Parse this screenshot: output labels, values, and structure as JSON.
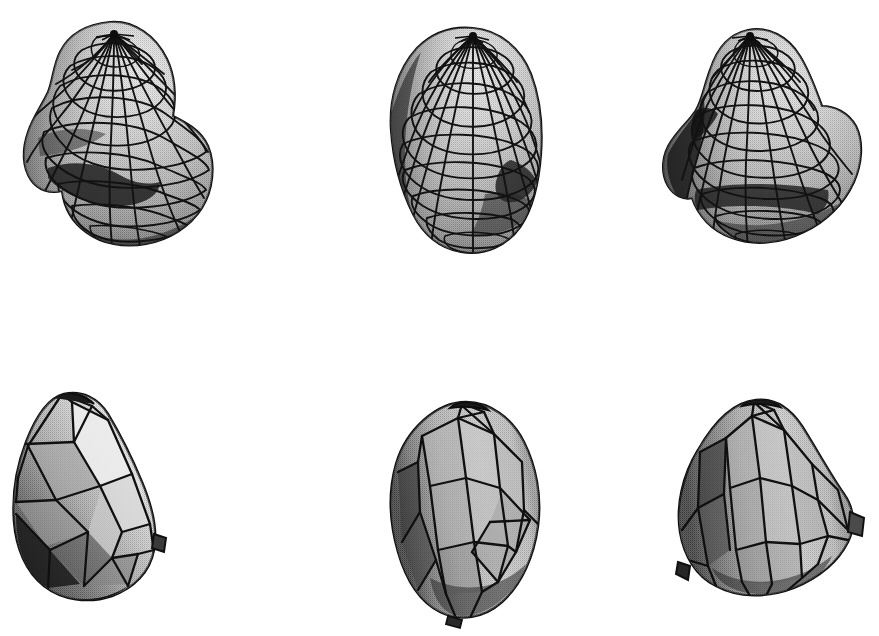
{
  "figure": {
    "title": "Six shaded 3D mesh surfaces",
    "background_color": "#ffffff",
    "canvas": {
      "width": 879,
      "height": 636
    },
    "rows": 2,
    "columns": 3,
    "render_style": "halftone-dithered grayscale shaded surface with black wireframe",
    "ink_color": "#111111",
    "palette": {
      "highlight": "#efefef",
      "light": "#d2d2d2",
      "mid": "#aeaeae",
      "mid_dark": "#8c8c8c",
      "dark": "#5e5e5e",
      "shadow": "#2f2f2f",
      "deep_shadow": "#141414",
      "wire": "#141414",
      "background": "#ffffff"
    }
  },
  "shapes": [
    {
      "id": "shape-1",
      "name": "blob-top-left",
      "row": 1,
      "column": 1,
      "mesh_type": "quadrilateral lat-long grid",
      "pole_visible": true,
      "pole_style": "radial meridian convergence",
      "bbox": {
        "x": 16,
        "y": 16,
        "width": 200,
        "height": 230
      },
      "light_direction": "upper-right",
      "features": "bulbous upper lobe with pole cap, deep concave crease at lower left, secondary lobe at bottom",
      "latitude_bands": 11,
      "meridians": 24
    },
    {
      "id": "shape-2",
      "name": "blob-top-center",
      "row": 1,
      "column": 2,
      "mesh_type": "quadrilateral lat-long grid",
      "pole_visible": true,
      "pole_style": "radial meridian convergence",
      "bbox": {
        "x": 372,
        "y": 22,
        "width": 190,
        "height": 232
      },
      "light_direction": "upper-right",
      "features": "ovoid body, faceted flat bottom, concave notch on lower right flank",
      "latitude_bands": 11,
      "meridians": 24
    },
    {
      "id": "shape-3",
      "name": "blob-top-right",
      "row": 1,
      "column": 3,
      "mesh_type": "quadrilateral lat-long grid",
      "pole_visible": true,
      "pole_style": "radial meridian convergence",
      "bbox": {
        "x": 660,
        "y": 22,
        "width": 205,
        "height": 225
      },
      "light_direction": "upper-right",
      "features": "conical upper pole, protruding lobe on left flank, horizontal shelf crease near bottom",
      "latitude_bands": 11,
      "meridians": 24
    },
    {
      "id": "shape-4",
      "name": "polyhedral-bottom-left",
      "row": 2,
      "column": 1,
      "mesh_type": "coarse triangulated facets",
      "pole_visible": true,
      "pole_style": "flattened apex",
      "bbox": {
        "x": 10,
        "y": 390,
        "width": 152,
        "height": 215
      },
      "light_direction": "upper-right",
      "features": "tilted wedge form, bright highlight facets on upper right, deep shadow along lower left rim, small spur at right edge",
      "facet_count": 42
    },
    {
      "id": "shape-5",
      "name": "polyhedral-bottom-center",
      "row": 2,
      "column": 2,
      "mesh_type": "coarse triangulated facets with spiral banding",
      "pole_visible": true,
      "pole_style": "flattened apex",
      "bbox": {
        "x": 382,
        "y": 400,
        "width": 170,
        "height": 222
      },
      "light_direction": "upper-right",
      "features": "upright ovoid, diagonal spiral facet bands on right flank, dark rim on left silhouette",
      "facet_count": 44
    },
    {
      "id": "shape-6",
      "name": "polyhedral-bottom-right",
      "row": 2,
      "column": 3,
      "mesh_type": "coarse triangulated facets",
      "pole_visible": true,
      "pole_style": "flattened apex",
      "bbox": {
        "x": 676,
        "y": 398,
        "width": 190,
        "height": 210
      },
      "light_direction": "upper-right",
      "features": "broad conical body, angular protrusion at right mid-height, spur at lower left",
      "facet_count": 40
    }
  ]
}
